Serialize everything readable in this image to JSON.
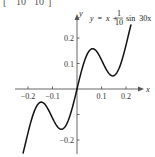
{
  "chart_data": {
    "type": "line",
    "title": "",
    "equation": {
      "lhs": "y",
      "eq": "=",
      "x_term": "x",
      "plus": "+",
      "frac_num": "1",
      "frac_den": "10",
      "func": "sin",
      "arg": "30x"
    },
    "clipped_header_fragment": {
      "open_bracket": "[",
      "left_den": "10",
      "right_den": "10",
      "close_bracket": "]"
    },
    "xlabel": "x",
    "ylabel": "y",
    "xlim": [
      -0.25,
      0.26
    ],
    "ylim": [
      -0.25,
      0.27
    ],
    "grid": false,
    "x_ticks": [
      {
        "value": -0.2,
        "label": "−0.2"
      },
      {
        "value": -0.1,
        "label": "−0.1"
      },
      {
        "value": 0.1,
        "label": "0.1"
      },
      {
        "value": 0.2,
        "label": "0.2"
      }
    ],
    "y_ticks": [
      {
        "value": 0.2,
        "label": "0.2"
      },
      {
        "value": 0.1,
        "label": "0.1"
      },
      {
        "value": -0.1,
        "label": ""
      },
      {
        "value": -0.2,
        "label": "−0.2"
      }
    ],
    "series": [
      {
        "name": "y = x + (1/10) sin 30x",
        "color": "#111111",
        "x": [
          -0.22,
          -0.2,
          -0.18,
          -0.16,
          -0.14,
          -0.12,
          -0.1,
          -0.08,
          -0.06,
          -0.04,
          -0.02,
          0.0,
          0.02,
          0.04,
          0.06,
          0.08,
          0.1,
          0.12,
          0.14,
          0.16,
          0.18,
          0.2,
          0.22
        ],
        "y": [
          -0.251,
          -0.172,
          -0.102,
          -0.062,
          -0.053,
          -0.064,
          -0.114,
          -0.148,
          -0.157,
          -0.133,
          -0.076,
          0.0,
          0.076,
          0.133,
          0.157,
          0.148,
          0.114,
          0.064,
          0.053,
          0.062,
          0.102,
          0.172,
          0.251
        ]
      }
    ],
    "legend": null
  },
  "layout": {
    "origin_px": [
      77,
      89
    ],
    "px_per_unit_x": 245,
    "px_per_unit_y": 255
  }
}
